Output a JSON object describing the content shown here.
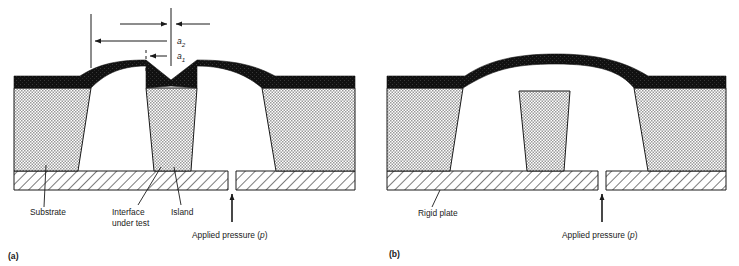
{
  "figure": {
    "panels": [
      {
        "id": "a",
        "caption": "(a)",
        "labels": {
          "substrate": "Substrate",
          "interface_line1": "Interface",
          "interface_line2": "under test",
          "island": "Island",
          "pressure": "Applied pressure (",
          "pressure_symbol": "p",
          "pressure_close": ")"
        },
        "dimensions": [
          {
            "name": "a2",
            "symbol": "a",
            "subscript": "2"
          },
          {
            "name": "a1",
            "symbol": "a",
            "subscript": "1"
          }
        ]
      },
      {
        "id": "b",
        "caption": "(b)",
        "labels": {
          "rigid_plate": "Rigid plate",
          "pressure": "Applied pressure (",
          "pressure_symbol": "p",
          "pressure_close": ")"
        }
      }
    ],
    "colors": {
      "film": "#111111",
      "substrate_fill": "#d9d9d9",
      "plate_fill": "#ffffff",
      "line": "#1a1a1a",
      "background": "#ffffff"
    }
  }
}
